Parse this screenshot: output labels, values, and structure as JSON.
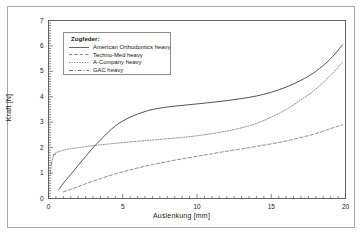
{
  "chart_data": {
    "type": "line",
    "title": "",
    "xlabel": "Auslenkung [mm]",
    "ylabel": "Kraft [N]",
    "xlim": [
      0,
      20
    ],
    "ylim": [
      0,
      7
    ],
    "xticks": [
      0,
      5,
      10,
      15,
      20
    ],
    "yticks": [
      0,
      1,
      2,
      3,
      4,
      5,
      6,
      7
    ],
    "xtick_labels": [
      "0",
      "5",
      "10",
      "15",
      "20"
    ],
    "ytick_labels": [
      "0",
      "1",
      "2",
      "3",
      "4",
      "5",
      "6",
      "7"
    ],
    "grid": false,
    "minor_ticks": true,
    "legend_title": "Zugfeder:",
    "legend_position": "upper-left-inside",
    "series": [
      {
        "name": "American Orthodontics heavy",
        "style": "solid",
        "color": "#4a4a4a",
        "x": [
          0.7,
          1.0,
          1.5,
          2.0,
          2.5,
          3.0,
          3.5,
          4.0,
          4.5,
          5.0,
          5.5,
          6.0,
          6.5,
          7.0,
          8.0,
          9.0,
          10.0,
          11.0,
          12.0,
          13.0,
          14.0,
          15.0,
          16.0,
          17.0,
          18.0,
          19.0,
          19.8
        ],
        "y": [
          0.35,
          0.6,
          0.95,
          1.3,
          1.65,
          2.0,
          2.3,
          2.6,
          2.85,
          3.05,
          3.2,
          3.32,
          3.42,
          3.5,
          3.6,
          3.66,
          3.72,
          3.78,
          3.85,
          3.93,
          4.03,
          4.18,
          4.38,
          4.65,
          5.0,
          5.5,
          6.05
        ]
      },
      {
        "name": "Techno-Med heavy",
        "style": "dashed",
        "color": "#6a6a6a",
        "x": [
          1.0,
          1.5,
          2.0,
          2.5,
          3.0,
          4.0,
          5.0,
          6.0,
          7.0,
          8.0,
          9.0,
          10.0,
          11.0,
          12.0,
          13.0,
          14.0,
          15.0,
          16.0,
          17.0,
          18.0,
          19.0,
          19.8
        ],
        "y": [
          0.26,
          0.36,
          0.47,
          0.58,
          0.68,
          0.88,
          1.05,
          1.2,
          1.33,
          1.45,
          1.56,
          1.66,
          1.76,
          1.86,
          1.95,
          2.05,
          2.15,
          2.26,
          2.4,
          2.55,
          2.75,
          2.9
        ]
      },
      {
        "name": "A-Company heavy",
        "style": "dotted",
        "color": "#6a6a6a",
        "x": [
          0.3,
          0.6,
          1.0,
          1.5,
          2.0,
          3.0,
          4.0,
          5.0,
          6.0,
          7.0,
          8.0,
          9.0,
          10.0,
          11.0,
          12.0,
          13.0,
          14.0,
          15.0,
          16.0,
          17.0,
          18.0,
          19.0,
          19.8
        ],
        "y": [
          1.72,
          1.82,
          1.9,
          1.96,
          2.0,
          2.08,
          2.14,
          2.2,
          2.25,
          2.3,
          2.35,
          2.4,
          2.47,
          2.55,
          2.65,
          2.78,
          2.95,
          3.2,
          3.5,
          3.88,
          4.3,
          4.85,
          5.35
        ]
      },
      {
        "name": "GAC heavy",
        "style": "dashdot",
        "color": "#5a5a5a",
        "x": [
          0.12,
          0.2,
          0.3,
          0.38,
          0.5
        ],
        "y": [
          0.95,
          1.35,
          1.62,
          1.72,
          1.74
        ]
      }
    ]
  },
  "axes": {
    "x_title": "Auslenkung [mm]",
    "y_title": "Kraft [N]"
  },
  "legend": {
    "title": "Zugfeder:",
    "items": [
      {
        "label": "American Orthodontics heavy",
        "style": "solid"
      },
      {
        "label": "Techno-Med heavy",
        "style": "dashed"
      },
      {
        "label": "A-Company heavy",
        "style": "dotted"
      },
      {
        "label": "GAC heavy",
        "style": "dashdot"
      }
    ]
  }
}
